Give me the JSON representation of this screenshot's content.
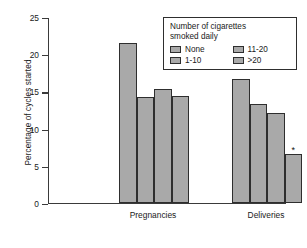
{
  "chart_data": {
    "type": "bar",
    "title": "",
    "xlabel": "",
    "ylabel": "Percentage of cycles started",
    "ylim": [
      0,
      25
    ],
    "yticks": [
      0,
      5,
      10,
      15,
      20,
      25
    ],
    "ytick_labels": [
      "0",
      "5",
      "10",
      "15",
      "20",
      "25"
    ],
    "grid": false,
    "legend_position": "top-right",
    "legend_title": "Number of cigarettes smoked daily",
    "categories": [
      "Pregnancies",
      "Deliveries"
    ],
    "series": [
      {
        "name": "None",
        "values": [
          21.4,
          16.6
        ]
      },
      {
        "name": "1-10",
        "values": [
          14.2,
          13.2
        ]
      },
      {
        "name": "11-20",
        "values": [
          15.3,
          12.0
        ]
      },
      {
        "name": ">20",
        "values": [
          14.3,
          6.6
        ]
      }
    ],
    "annotations": [
      {
        "text": "*",
        "series": ">20",
        "category": "Deliveries"
      }
    ]
  },
  "legend": {
    "title_line_1": "Number of cigarettes",
    "title_line_2": "smoked daily",
    "items": [
      {
        "label": "None"
      },
      {
        "label": "11-20"
      },
      {
        "label": "1-10"
      },
      {
        "label": ">20"
      }
    ]
  },
  "axes": {
    "y_title": "Percentage of cycles started",
    "y_tick_labels": [
      "25",
      "20",
      "15",
      "10",
      "5",
      "0"
    ],
    "x_group_labels": [
      "Pregnancies",
      "Deliveries"
    ]
  },
  "colors": {
    "bar_fill": "#a9a9a9",
    "bar_stroke": "#2e2e2e",
    "axis": "#3a3a3a",
    "text": "#1a1a1a",
    "background": "#ffffff"
  },
  "caption": {
    "text": ""
  }
}
